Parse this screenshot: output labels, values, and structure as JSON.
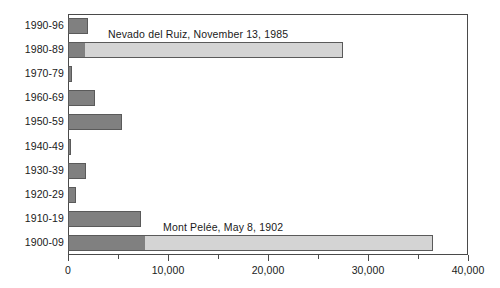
{
  "chart_data": {
    "type": "bar",
    "orientation": "horizontal",
    "title": "",
    "xlabel": "",
    "ylabel": "",
    "xlim": [
      0,
      40000
    ],
    "grid": false,
    "legend": null,
    "categories": [
      "1990-96",
      "1980-89",
      "1970-79",
      "1960-69",
      "1950-59",
      "1940-49",
      "1930-39",
      "1920-29",
      "1910-19",
      "1900-09"
    ],
    "series": [
      {
        "name": "base",
        "color": "#808080",
        "values": [
          2000,
          1700,
          400,
          2700,
          5400,
          300,
          1800,
          800,
          7300,
          7700
        ]
      },
      {
        "name": "single-event",
        "color": "#d4d4d4",
        "values": [
          0,
          25800,
          0,
          0,
          0,
          0,
          0,
          0,
          0,
          28800
        ]
      }
    ],
    "totals": [
      2000,
      27500,
      400,
      2700,
      5400,
      300,
      1800,
      800,
      7300,
      36500
    ],
    "xticks": [
      0,
      10000,
      20000,
      30000,
      40000
    ],
    "xtick_labels": [
      "0",
      "10,000",
      "20,000",
      "30,000",
      "40,000"
    ],
    "xminor_ticks": [
      5000,
      15000,
      25000,
      35000
    ],
    "annotations": [
      {
        "text": "Nevado del Ruiz, November 13, 1985",
        "category": "1980-89",
        "value": 4000
      },
      {
        "text": "Mont Pelée, May 8, 1902",
        "category": "1900-09",
        "value": 9500
      }
    ]
  },
  "colors": {
    "bar_dark": "#808080",
    "bar_light": "#d4d4d4",
    "bar_edge": "#5a5a5a",
    "axis": "#4a4a4a",
    "text": "#1a1a1a",
    "background": "#ffffff"
  }
}
